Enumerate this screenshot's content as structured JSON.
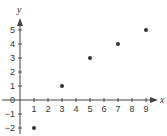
{
  "chart_data": {
    "type": "scatter",
    "title": "",
    "xlabel": "x",
    "ylabel": "y",
    "xlim": [
      0,
      9
    ],
    "ylim": [
      -2,
      5
    ],
    "grid": false,
    "legend": null,
    "x_ticks": [
      1,
      2,
      3,
      4,
      5,
      6,
      7,
      8,
      9
    ],
    "y_ticks": [
      -2,
      -1,
      0,
      1,
      2,
      3,
      4,
      5
    ],
    "x_tick_labels": [
      "1",
      "2",
      "3",
      "4",
      "5",
      "6",
      "7",
      "8",
      "9"
    ],
    "y_tick_labels": [
      "−2",
      "−1",
      "0",
      "1",
      "2",
      "3",
      "4",
      "5"
    ],
    "points": [
      {
        "x": 1,
        "y": -2
      },
      {
        "x": 3,
        "y": 1
      },
      {
        "x": 5,
        "y": 3
      },
      {
        "x": 7,
        "y": 4
      },
      {
        "x": 9,
        "y": 5
      }
    ],
    "colors": {
      "axis": "#444444",
      "point": "#333333",
      "text": "#333333"
    }
  }
}
